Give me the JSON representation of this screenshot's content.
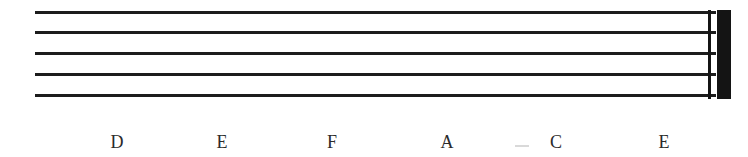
{
  "document": {
    "title": "Blank music staff with note-name labels",
    "background_color": "#ffffff",
    "ink_color": "#1c1c1c"
  },
  "staff": {
    "name": "five-line-staff",
    "line_count": 5,
    "clef": "",
    "notes": [],
    "lines": [
      {
        "index": 1,
        "label": "staff-line-1"
      },
      {
        "index": 2,
        "label": "staff-line-2"
      },
      {
        "index": 3,
        "label": "staff-line-3"
      },
      {
        "index": 4,
        "label": "staff-line-4"
      },
      {
        "index": 5,
        "label": "staff-line-5"
      }
    ],
    "barline": {
      "type": "final-barline",
      "thin_label": "thin-barline",
      "thick_label": "thick-barline"
    }
  },
  "note_letters": {
    "caption": "",
    "items": [
      {
        "label": "D",
        "x": 117
      },
      {
        "label": "E",
        "x": 222
      },
      {
        "label": "F",
        "x": 332
      },
      {
        "label": "A",
        "x": 447
      },
      {
        "label": "C",
        "x": 556
      },
      {
        "label": "E",
        "x": 664
      }
    ]
  }
}
